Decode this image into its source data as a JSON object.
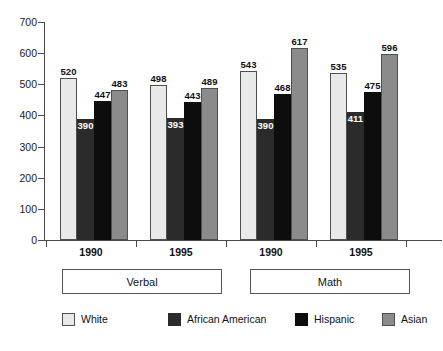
{
  "chart_data": {
    "type": "bar",
    "title": "",
    "xlabel": "",
    "ylabel": "",
    "ylim": [
      0,
      700
    ],
    "yticks": [
      0,
      100,
      200,
      300,
      400,
      500,
      600,
      700
    ],
    "grid": false,
    "legend_position": "bottom",
    "categories": [
      "1990",
      "1995",
      "1990",
      "1995"
    ],
    "group_labels": [
      "Verbal",
      "Math"
    ],
    "series": [
      {
        "name": "White",
        "color": "#e9e9e9",
        "values": [
          520,
          498,
          543,
          535
        ]
      },
      {
        "name": "African American",
        "color": "#2b2b2b",
        "values": [
          390,
          393,
          390,
          411
        ]
      },
      {
        "name": "Hispanic",
        "color": "#0d0d0d",
        "values": [
          447,
          443,
          468,
          475
        ]
      },
      {
        "name": "Asian",
        "color": "#8b8b8b",
        "values": [
          483,
          489,
          617,
          596
        ]
      }
    ]
  },
  "axis": {
    "y_tick_labels": [
      "700",
      "600",
      "500",
      "400",
      "300",
      "200",
      "100",
      "0"
    ]
  },
  "subjects": [
    {
      "label": "Verbal"
    },
    {
      "label": "Math"
    }
  ],
  "years": [
    "1990",
    "1995",
    "1990",
    "1995"
  ],
  "legend": {
    "items": [
      {
        "label": "White",
        "swatch": "legend-swatch-white"
      },
      {
        "label": "African American",
        "swatch": "legend-swatch-african-american"
      },
      {
        "label": "Hispanic",
        "swatch": "legend-swatch-hispanic"
      },
      {
        "label": "Asian",
        "swatch": "legend-swatch-asian"
      }
    ]
  }
}
